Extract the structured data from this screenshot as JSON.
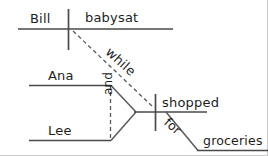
{
  "diagram": {
    "kind": "reed-kellogg-sentence-diagram",
    "sentence": "Bill babysat while Ana and Lee shopped for groceries",
    "ink_color": "#4a4a4a",
    "text_color": "#1e1e1e",
    "background_color": "#ffffff",
    "frame_color": "#c9c9c9",
    "labels": {
      "subject_main": "Bill",
      "verb_main": "babysat",
      "conjunction_clause": "while",
      "subject_sub_1": "Ana",
      "subject_sub_2": "Lee",
      "conjunction_subjects": "and",
      "verb_sub": "shopped",
      "preposition": "for",
      "object_of_preposition": "groceries"
    }
  }
}
